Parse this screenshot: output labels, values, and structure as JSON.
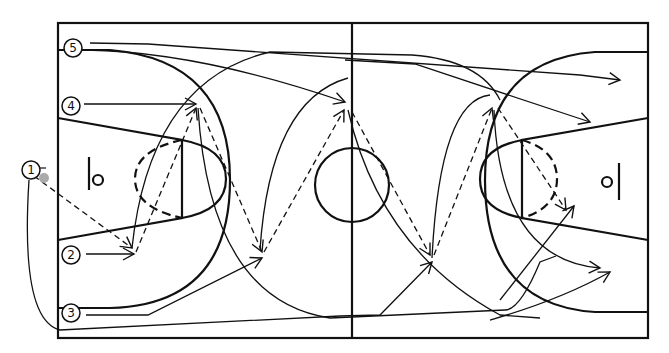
{
  "diagram": {
    "type": "basketball-full-court-play",
    "colors": {
      "lines": "#111111",
      "background": "#ffffff",
      "ball": "#aaaaaa"
    },
    "players": [
      {
        "id": "1",
        "label": "1",
        "has_ball": true
      },
      {
        "id": "2",
        "label": "2"
      },
      {
        "id": "3",
        "label": "3"
      },
      {
        "id": "4",
        "label": "4"
      },
      {
        "id": "5",
        "label": "5"
      }
    ],
    "legend": {
      "solid_arrow": "player movement",
      "dashed_arrow": "pass"
    }
  }
}
